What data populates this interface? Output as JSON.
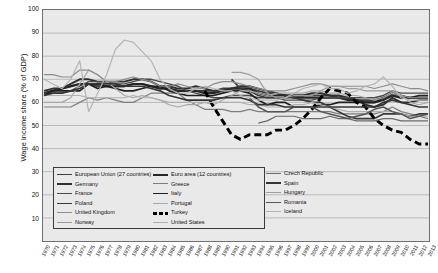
{
  "axes": {
    "ylabel": "Wage income share (% of GDP)",
    "yticks": [
      100,
      90,
      80,
      70,
      60,
      50,
      40,
      30,
      20,
      10
    ],
    "ylim": [
      0,
      100
    ],
    "xlim": [
      1970,
      2013
    ]
  },
  "legend": {
    "columns": [
      [
        {
          "label": "European Union (27 countries)",
          "color": "#3f3f3f",
          "width": 1.9,
          "dash": "none"
        },
        {
          "label": "Germany",
          "color": "#2f2f2f",
          "width": 1.9,
          "dash": "none"
        },
        {
          "label": "France",
          "color": "#4a4a4a",
          "width": 1.4,
          "dash": "none"
        },
        {
          "label": "Poland",
          "color": "#3a3a3a",
          "width": 1.7,
          "dash": "none"
        },
        {
          "label": "United Kingdom",
          "color": "#8d8d8d",
          "width": 1.2,
          "dash": "none"
        },
        {
          "label": "Norway",
          "color": "#9a9a9a",
          "width": 1.2,
          "dash": "none"
        }
      ],
      [
        {
          "label": "Euro area (12 countries)",
          "color": "#262626",
          "width": 2.1,
          "dash": "none"
        },
        {
          "label": "Greece",
          "color": "#7e7e7e",
          "width": 1.2,
          "dash": "none"
        },
        {
          "label": "Italy",
          "color": "#1f1f1f",
          "width": 1.7,
          "dash": "none"
        },
        {
          "label": "Portugal",
          "color": "#a8a8a8",
          "width": 1.2,
          "dash": "none"
        },
        {
          "label": "Turkey",
          "color": "#000000",
          "width": 3.0,
          "dash": "dashed"
        },
        {
          "label": "United States",
          "color": "#b0b0b0",
          "width": 1.2,
          "dash": "none"
        }
      ],
      [
        {
          "label": "Czech Republic",
          "color": "#6b6b6b",
          "width": 1.2,
          "dash": "none"
        },
        {
          "label": "Spain",
          "color": "#343434",
          "width": 1.7,
          "dash": "none"
        },
        {
          "label": "Hungary",
          "color": "#9d9d9d",
          "width": 1.2,
          "dash": "none"
        },
        {
          "label": "Romania",
          "color": "#555555",
          "width": 1.5,
          "dash": "none"
        },
        {
          "label": "Iceland",
          "color": "#b5b5b5",
          "width": 1.2,
          "dash": "none"
        }
      ]
    ]
  },
  "chart_data": {
    "type": "line",
    "title": "",
    "xlabel": "",
    "ylabel": "Wage income share (% of GDP)",
    "ylim": [
      0,
      100
    ],
    "grid": true,
    "legend_position": "inside-bottom-left",
    "x": [
      1970,
      1971,
      1972,
      1973,
      1974,
      1975,
      1976,
      1977,
      1978,
      1979,
      1980,
      1981,
      1982,
      1983,
      1984,
      1985,
      1986,
      1987,
      1988,
      1989,
      1990,
      1991,
      1992,
      1993,
      1994,
      1995,
      1996,
      1997,
      1998,
      1999,
      2000,
      2001,
      2002,
      2003,
      2004,
      2005,
      2006,
      2007,
      2008,
      2009,
      2010,
      2011,
      2012,
      2013
    ],
    "series": [
      {
        "name": "European Union (27 countries)",
        "color": "#3f3f3f",
        "width": 1.9,
        "dash": "none",
        "values": [
          64,
          65,
          66,
          67,
          68,
          68,
          67,
          67,
          67,
          67,
          68,
          68,
          67,
          66,
          66,
          65,
          65,
          65,
          65,
          65,
          66,
          66,
          66,
          66,
          65,
          64,
          64,
          63,
          63,
          63,
          63,
          63,
          63,
          62,
          62,
          61,
          61,
          61,
          62,
          63,
          62,
          62,
          62,
          62
        ]
      },
      {
        "name": "Euro area (12 countries)",
        "color": "#262626",
        "width": 2.1,
        "dash": "none",
        "values": [
          64,
          65,
          66,
          67,
          68,
          68,
          68,
          67,
          67,
          67,
          68,
          68,
          67,
          66,
          66,
          65,
          65,
          65,
          64,
          64,
          65,
          66,
          66,
          66,
          64,
          63,
          63,
          63,
          62,
          62,
          62,
          62,
          62,
          62,
          61,
          61,
          60,
          60,
          61,
          63,
          62,
          62,
          62,
          62
        ]
      },
      {
        "name": "Germany",
        "color": "#2f2f2f",
        "width": 1.9,
        "dash": "none",
        "values": [
          65,
          66,
          66,
          68,
          70,
          70,
          69,
          69,
          69,
          69,
          70,
          70,
          69,
          67,
          67,
          66,
          66,
          67,
          66,
          65,
          65,
          66,
          67,
          67,
          66,
          65,
          64,
          63,
          63,
          63,
          64,
          64,
          63,
          63,
          62,
          61,
          59,
          58,
          59,
          62,
          60,
          60,
          61,
          61
        ]
      },
      {
        "name": "Greece",
        "color": "#7e7e7e",
        "width": 1.2,
        "dash": "none",
        "values": [
          58,
          58,
          58,
          58,
          60,
          62,
          61,
          62,
          61,
          60,
          60,
          62,
          64,
          64,
          64,
          64,
          61,
          59,
          57,
          57,
          57,
          56,
          56,
          57,
          56,
          56,
          56,
          56,
          56,
          56,
          56,
          56,
          56,
          55,
          55,
          55,
          55,
          55,
          56,
          58,
          56,
          55,
          54,
          53
        ]
      },
      {
        "name": "France",
        "color": "#4a4a4a",
        "width": 1.4,
        "dash": "none",
        "values": [
          64,
          64,
          64,
          65,
          67,
          69,
          69,
          69,
          68,
          68,
          69,
          70,
          70,
          69,
          68,
          67,
          65,
          64,
          63,
          62,
          62,
          63,
          63,
          63,
          62,
          62,
          62,
          61,
          61,
          61,
          61,
          62,
          62,
          62,
          62,
          62,
          62,
          62,
          63,
          65,
          64,
          64,
          64,
          64
        ]
      },
      {
        "name": "Italy",
        "color": "#1f1f1f",
        "width": 1.7,
        "dash": "none",
        "values": [
          63,
          65,
          65,
          65,
          65,
          68,
          66,
          67,
          66,
          65,
          65,
          66,
          67,
          67,
          65,
          64,
          63,
          63,
          63,
          63,
          64,
          65,
          65,
          64,
          61,
          59,
          60,
          60,
          58,
          58,
          58,
          59,
          59,
          60,
          60,
          60,
          60,
          60,
          62,
          64,
          63,
          62,
          63,
          63
        ]
      },
      {
        "name": "Poland",
        "color": "#3a3a3a",
        "width": 1.7,
        "dash": "none",
        "values": [
          null,
          null,
          null,
          null,
          null,
          null,
          null,
          null,
          null,
          null,
          null,
          null,
          null,
          null,
          null,
          null,
          null,
          null,
          null,
          null,
          null,
          70,
          66,
          65,
          63,
          62,
          62,
          62,
          62,
          61,
          60,
          60,
          58,
          56,
          54,
          53,
          53,
          53,
          55,
          55,
          55,
          54,
          55,
          55
        ]
      },
      {
        "name": "Portugal",
        "color": "#a8a8a8",
        "width": 1.2,
        "dash": "none",
        "values": [
          60,
          60,
          60,
          62,
          68,
          74,
          72,
          69,
          66,
          63,
          62,
          63,
          62,
          61,
          59,
          58,
          59,
          59,
          60,
          59,
          61,
          63,
          65,
          65,
          64,
          63,
          64,
          64,
          64,
          64,
          65,
          65,
          64,
          64,
          63,
          63,
          62,
          61,
          62,
          64,
          63,
          60,
          59,
          60
        ]
      },
      {
        "name": "United Kingdom",
        "color": "#8d8d8d",
        "width": 1.2,
        "dash": "none",
        "values": [
          72,
          72,
          71,
          71,
          74,
          74,
          72,
          69,
          69,
          70,
          71,
          70,
          69,
          67,
          67,
          68,
          67,
          66,
          66,
          68,
          69,
          69,
          68,
          67,
          66,
          65,
          65,
          65,
          66,
          67,
          68,
          68,
          67,
          67,
          67,
          67,
          67,
          66,
          67,
          68,
          67,
          66,
          66,
          65
        ]
      },
      {
        "name": "Turkey",
        "color": "#000000",
        "width": 3.0,
        "dash": "dashed",
        "values": [
          null,
          null,
          null,
          null,
          null,
          null,
          null,
          null,
          null,
          null,
          null,
          null,
          null,
          null,
          null,
          null,
          null,
          null,
          65,
          58,
          52,
          46,
          44,
          46,
          46,
          46,
          48,
          48,
          50,
          53,
          57,
          62,
          66,
          65,
          64,
          60,
          58,
          53,
          50,
          48,
          47,
          44,
          42,
          42
        ]
      },
      {
        "name": "United States",
        "color": "#b0b0b0",
        "width": 1.2,
        "dash": "none",
        "values": [
          63,
          63,
          63,
          63,
          63,
          62,
          62,
          62,
          62,
          62,
          63,
          62,
          62,
          61,
          60,
          60,
          60,
          60,
          60,
          60,
          60,
          60,
          60,
          59,
          59,
          58,
          58,
          58,
          59,
          59,
          60,
          59,
          58,
          57,
          56,
          56,
          56,
          56,
          56,
          56,
          55,
          54,
          54,
          54
        ]
      },
      {
        "name": "Czech Republic",
        "color": "#6b6b6b",
        "width": 1.2,
        "dash": "none",
        "values": [
          null,
          null,
          null,
          null,
          null,
          null,
          null,
          null,
          null,
          null,
          null,
          null,
          null,
          null,
          null,
          null,
          null,
          null,
          null,
          null,
          null,
          null,
          null,
          null,
          51,
          52,
          54,
          54,
          54,
          53,
          53,
          53,
          54,
          53,
          53,
          52,
          52,
          52,
          53,
          53,
          52,
          52,
          52,
          52
        ]
      },
      {
        "name": "Spain",
        "color": "#343434",
        "width": 1.7,
        "dash": "none",
        "values": [
          63,
          64,
          64,
          65,
          66,
          68,
          68,
          68,
          68,
          67,
          67,
          67,
          66,
          65,
          63,
          62,
          61,
          61,
          61,
          61,
          62,
          62,
          62,
          61,
          59,
          59,
          59,
          58,
          58,
          58,
          58,
          58,
          58,
          58,
          58,
          58,
          58,
          58,
          60,
          61,
          60,
          59,
          58,
          58
        ]
      },
      {
        "name": "Hungary",
        "color": "#9d9d9d",
        "width": 1.2,
        "dash": "none",
        "values": [
          null,
          null,
          null,
          null,
          null,
          null,
          null,
          null,
          null,
          null,
          null,
          null,
          null,
          null,
          null,
          null,
          null,
          null,
          null,
          null,
          null,
          73,
          73,
          72,
          70,
          64,
          62,
          62,
          63,
          63,
          63,
          65,
          67,
          67,
          66,
          66,
          65,
          65,
          65,
          65,
          63,
          62,
          62,
          62
        ]
      },
      {
        "name": "Romania",
        "color": "#555555",
        "width": 1.5,
        "dash": "none",
        "values": [
          null,
          null,
          null,
          null,
          null,
          null,
          null,
          null,
          null,
          null,
          null,
          null,
          null,
          null,
          null,
          null,
          null,
          null,
          null,
          null,
          null,
          null,
          null,
          62,
          58,
          56,
          56,
          56,
          58,
          58,
          58,
          56,
          55,
          54,
          53,
          54,
          55,
          57,
          58,
          56,
          55,
          53,
          54,
          55
        ]
      },
      {
        "name": "Iceland",
        "color": "#b5b5b5",
        "width": 1.2,
        "dash": "none",
        "values": [
          70,
          68,
          66,
          70,
          78,
          56,
          64,
          72,
          83,
          87,
          86,
          82,
          78,
          70,
          66,
          64,
          64,
          66,
          67,
          66,
          65,
          65,
          63,
          62,
          61,
          61,
          61,
          62,
          64,
          66,
          67,
          68,
          66,
          66,
          64,
          65,
          67,
          68,
          71,
          67,
          62,
          61,
          61,
          61
        ]
      }
    ]
  }
}
